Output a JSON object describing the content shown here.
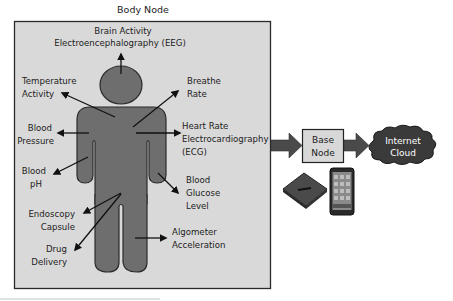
{
  "diagram": {
    "title": "Body Node",
    "labels": {
      "brain": [
        "Brain Activity",
        "Electroencephalography (EEG)"
      ],
      "temperature": [
        "Temperature",
        "Activity"
      ],
      "breathe": [
        "Breathe",
        "Rate"
      ],
      "blood_pressure": [
        "Blood",
        "Pressure"
      ],
      "heart": [
        "Heart Rate",
        "Electrocardiography",
        "(ECG)"
      ],
      "blood_ph": [
        "Blood",
        "pH"
      ],
      "blood_glucose": [
        "Blood",
        "Glucose",
        "Level"
      ],
      "endoscopy": [
        "Endoscopy",
        "Capsule"
      ],
      "drug": [
        "Drug",
        "Delivery"
      ],
      "algometer": [
        "Algometer",
        "Acceleration"
      ]
    },
    "base_node": [
      "Base",
      "Node"
    ],
    "internet_cloud": [
      "Internet",
      "Cloud"
    ],
    "devices": [
      "gateway-device-icon",
      "smartphone-icon"
    ],
    "colors": {
      "panel_fill": "#d9d9d9",
      "panel_border": "#2a2a2a",
      "figure_fill": "#6e6e6e",
      "figure_border": "#2b2b2b",
      "flow_arrow": "#4a4a4a",
      "base_node_fill": "#d8d8d8",
      "cloud_fill": "#3a3a3a"
    }
  }
}
